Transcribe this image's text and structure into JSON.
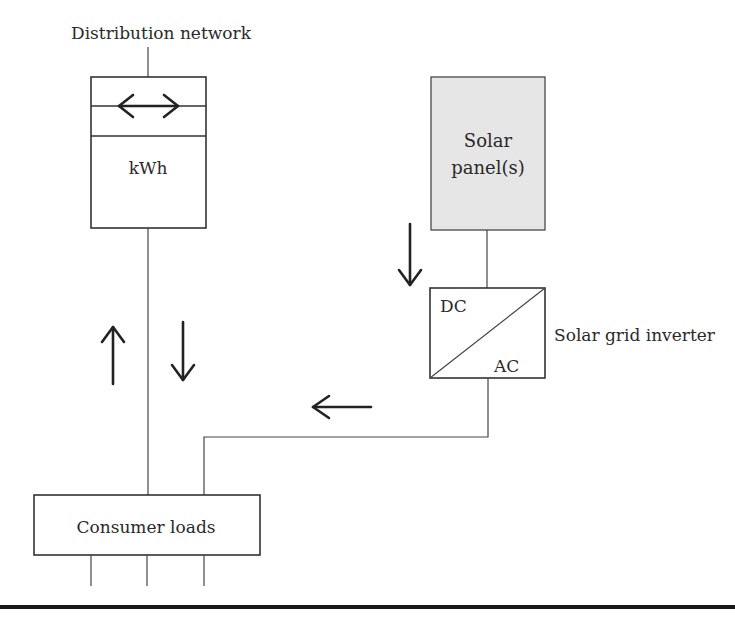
{
  "diagram": {
    "type": "grid-tied solar system block diagram",
    "labels": {
      "distribution_network": "Distribution network",
      "meter_unit": "kWh",
      "solar_panel_line1": "Solar",
      "solar_panel_line2": "panel(s)",
      "inverter_dc": "DC",
      "inverter_ac": "AC",
      "inverter_label": "Solar grid inverter",
      "consumer_loads": "Consumer loads"
    },
    "arrows": [
      {
        "name": "bidirectional-meter-arrow",
        "direction": "left-right"
      },
      {
        "name": "export-to-grid-arrow",
        "direction": "up"
      },
      {
        "name": "import-from-grid-arrow",
        "direction": "down"
      },
      {
        "name": "panel-to-inverter-arrow",
        "direction": "down"
      },
      {
        "name": "inverter-to-loads-arrow",
        "direction": "left"
      }
    ],
    "colors": {
      "panel_fill": "#e6e6e6",
      "line": "#333333"
    }
  }
}
